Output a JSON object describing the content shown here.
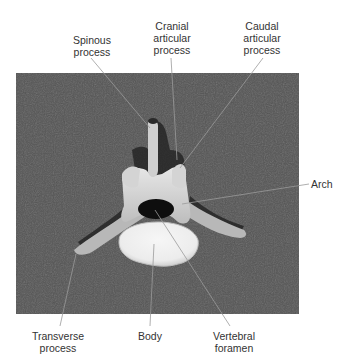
{
  "figure": {
    "title_fragment": "",
    "colors": {
      "background_photo": "#4a4a4a",
      "bone": "#d8d8d8",
      "body_face": "#f2f2f2",
      "leader_line": "#8a8a8a",
      "label_text": "#333333"
    },
    "labels": {
      "spinous_process": {
        "line1": "Spinous",
        "line2": "process"
      },
      "cranial_articular_process": {
        "line1": "Cranial",
        "line2": "articular",
        "line3": "process"
      },
      "caudal_articular_process": {
        "line1": "Caudal",
        "line2": "articular",
        "line3": "process"
      },
      "arch": {
        "line1": "Arch"
      },
      "transverse_process": {
        "line1": "Transverse",
        "line2": "process"
      },
      "body": {
        "line1": "Body"
      },
      "vertebral_foramen": {
        "line1": "Vertebral",
        "line2": "foramen"
      }
    }
  }
}
